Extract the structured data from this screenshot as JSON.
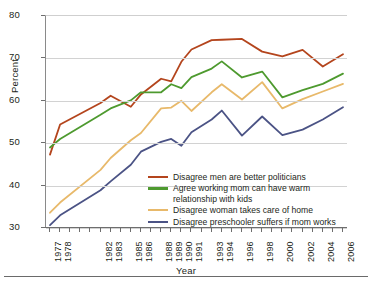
{
  "chart_data": {
    "type": "line",
    "title": "",
    "xlabel": "Year",
    "ylabel": "Percent",
    "ylim": [
      30,
      80
    ],
    "yticks": [
      30,
      40,
      50,
      60,
      70,
      80
    ],
    "grid": true,
    "legend_position": "inside-lower-center",
    "x": [
      1977,
      1978,
      1982,
      1983,
      1985,
      1986,
      1988,
      1989,
      1990,
      1991,
      1993,
      1994,
      1996,
      1998,
      2000,
      2002,
      2004,
      2006
    ],
    "tick_labels": [
      "1977",
      "1978",
      "1982",
      "1983",
      "1985",
      "1986",
      "1988",
      "1989",
      "1990",
      "1991",
      "1993",
      "1994",
      "1996",
      "1998",
      "2000",
      "2002",
      "2004",
      "2006"
    ],
    "series": [
      {
        "name": "Disagree men are better politicians",
        "color": "#b4451d",
        "values": [
          47.3,
          54.4,
          59.5,
          61.2,
          58.6,
          61.5,
          65.2,
          64.6,
          69.2,
          72.1,
          74.3,
          74.4,
          74.6,
          71.6,
          70.5,
          72.0,
          68.1,
          71.0
        ]
      },
      {
        "name": "Agree working mom can have warm\nrelationship with kids",
        "color": "#4e9a2f",
        "values": [
          49.0,
          51.0,
          56.7,
          58.2,
          60.1,
          62.0,
          62.0,
          63.9,
          63.0,
          65.6,
          67.6,
          69.3,
          65.5,
          66.9,
          60.8,
          62.5,
          64.0,
          66.4
        ]
      },
      {
        "name": "Disagree woman takes care of home",
        "color": "#e8b96a",
        "values": [
          33.6,
          36.0,
          43.7,
          46.5,
          50.7,
          52.4,
          58.2,
          58.4,
          60.0,
          57.6,
          62.0,
          63.9,
          60.3,
          64.4,
          58.2,
          60.4,
          62.2,
          64.0
        ]
      },
      {
        "name": "Disagree preschooler suffers if mom works",
        "color": "#4b5385",
        "values": [
          30.7,
          33.0,
          38.9,
          41.0,
          44.9,
          48.0,
          50.3,
          51.0,
          49.4,
          52.6,
          55.6,
          57.7,
          51.8,
          56.3,
          51.9,
          53.2,
          55.6,
          58.5
        ]
      }
    ]
  },
  "axes": {
    "ylabel": "Percent",
    "xlabel": "Year"
  },
  "legend": {
    "items": [
      {
        "label": "Disagree men are better politicians",
        "color": "#b4451d"
      },
      {
        "label": "Agree working mom can have warm\nrelationship with kids",
        "color": "#4e9a2f"
      },
      {
        "label": "Disagree woman takes care of home",
        "color": "#e8b96a"
      },
      {
        "label": "Disagree preschooler suffers if mom works",
        "color": "#4b5385"
      }
    ]
  }
}
